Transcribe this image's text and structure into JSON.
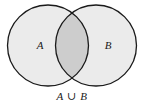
{
  "figure": {
    "kind": "venn-diagram",
    "caption": "A ∪ B",
    "background_color": "#ffffff",
    "outline_color": "#1a1a1a",
    "circle_fill_color": "#ebebeb",
    "intersection_fill_color": "#cdcdcd",
    "label_color": "#1a1a1a",
    "sets": [
      {
        "id": "A",
        "label": "A",
        "center_x": 48,
        "center_y": 45.5,
        "radius": 40.5,
        "label_x": 40,
        "label_y": 46
      },
      {
        "id": "B",
        "label": "B",
        "center_x": 96,
        "center_y": 45.5,
        "radius": 40.5,
        "label_x": 108,
        "label_y": 46
      }
    ],
    "regions": [
      {
        "id": "A-only",
        "name": "A only",
        "shaded": true,
        "shade": "light"
      },
      {
        "id": "B-only",
        "name": "B only",
        "shaded": true,
        "shade": "light"
      },
      {
        "id": "A-and-B",
        "name": "A intersect B",
        "shaded": true,
        "shade": "dark"
      }
    ],
    "operation_symbol": "∪",
    "operation_name": "union"
  }
}
